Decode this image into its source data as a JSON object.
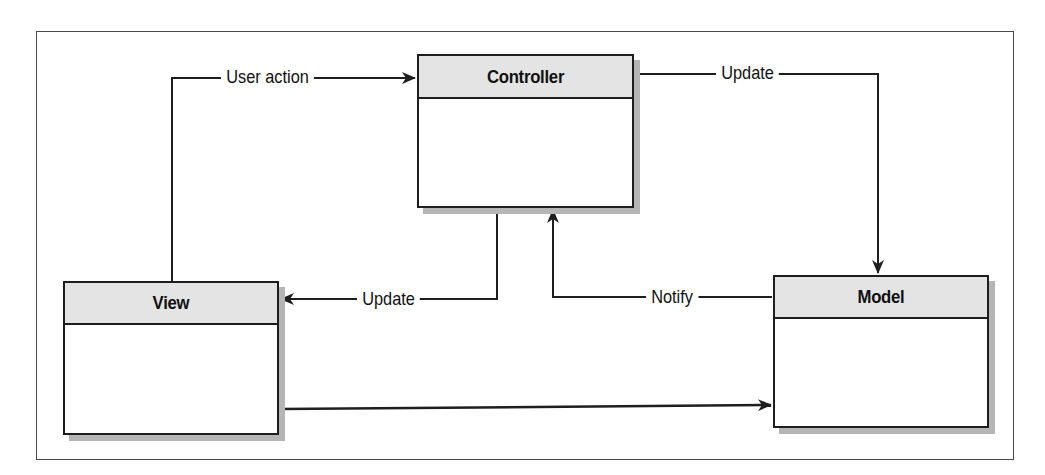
{
  "diagram": {
    "type": "MVC class interaction diagram",
    "nodes": [
      {
        "id": "controller",
        "title": "Controller"
      },
      {
        "id": "view",
        "title": "View"
      },
      {
        "id": "model",
        "title": "Model"
      }
    ],
    "edges": [
      {
        "from": "view",
        "to": "controller",
        "label": "User action"
      },
      {
        "from": "controller",
        "to": "model",
        "label": "Update"
      },
      {
        "from": "controller",
        "to": "view",
        "label": "Update"
      },
      {
        "from": "model",
        "to": "controller",
        "label": "Notify"
      },
      {
        "from": "view",
        "to": "model",
        "label": ""
      }
    ]
  },
  "labels": {
    "user_action": "User action",
    "controller_update": "Update",
    "view_update": "Update",
    "notify": "Notify"
  },
  "colors": {
    "line": "#1e1e1e",
    "header_fill": "#e4e4e4",
    "shadow": "#b5b5b5",
    "frame": "#4a4a4a"
  }
}
